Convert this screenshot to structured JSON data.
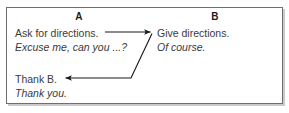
{
  "figure": {
    "columns": [
      {
        "label": "A"
      },
      {
        "label": "B"
      }
    ],
    "turns": [
      {
        "speaker": "A",
        "act": "Ask for directions.",
        "utterance": "Excuse me, can you ...?"
      },
      {
        "speaker": "B",
        "act": "Give directions.",
        "utterance": "Of course."
      },
      {
        "speaker": "A",
        "act": "Thank B.",
        "utterance": "Thank you."
      }
    ],
    "arrows": [
      {
        "name": "a-to-b",
        "from": "A",
        "to": "B",
        "direction": "right"
      },
      {
        "name": "b-to-a",
        "from": "B",
        "to": "A",
        "direction": "left"
      }
    ],
    "colors": {
      "border": "#6e6e6e",
      "text": "#3a3a3a",
      "header_text": "#1c1c1c",
      "arrow": "#1a1a1a",
      "background": "#ffffff"
    }
  }
}
